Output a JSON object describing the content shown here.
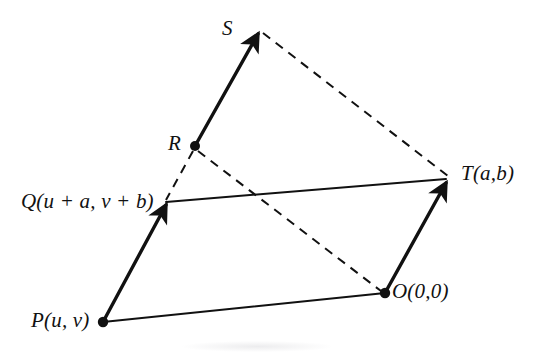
{
  "figure": {
    "background_color": "#ffffff",
    "stroke_color": "#111111",
    "width": 538,
    "height": 355
  },
  "points": {
    "S": {
      "label": "S",
      "x": 258,
      "y": 31,
      "has_dot": false
    },
    "R": {
      "label": "R",
      "x": 195,
      "y": 146,
      "has_dot": true
    },
    "T": {
      "label": "T(a,b)",
      "x": 447,
      "y": 180,
      "has_dot": false
    },
    "O": {
      "label": "O(0,0)",
      "x": 385,
      "y": 293,
      "has_dot": true
    },
    "Q": {
      "label": "Q(u + a,  v + b)",
      "x": 165,
      "y": 203,
      "has_dot": false
    },
    "P": {
      "label": "P(u, v)",
      "x": 103,
      "y": 322,
      "has_dot": true
    }
  },
  "edges": {
    "solid_vectors": [
      {
        "name": "vector-P-to-Q",
        "from": "P",
        "to": "Q",
        "arrow": true
      },
      {
        "name": "vector-O-to-T",
        "from": "O",
        "to": "T",
        "arrow": true
      },
      {
        "name": "vector-R-to-S",
        "from": "R",
        "to": "S",
        "arrow": true
      }
    ],
    "solid_lines": [
      {
        "name": "line-P-to-O",
        "from": "P",
        "to": "O"
      },
      {
        "name": "line-Q-to-T",
        "from": "Q",
        "to": "T"
      }
    ],
    "dashed_lines": [
      {
        "name": "dashed-R-to-Q",
        "from": "R",
        "to": "Q"
      },
      {
        "name": "dashed-R-to-O",
        "from": "R",
        "to": "O"
      },
      {
        "name": "dashed-S-to-T",
        "from": "S",
        "to": "T"
      }
    ]
  }
}
